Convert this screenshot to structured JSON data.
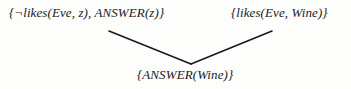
{
  "diagram": {
    "type": "resolution-proof-tree",
    "background_color": "#fdfdfc",
    "ink_color": "#1a1a1a",
    "parents": [
      {
        "id": "left-clause",
        "text": "{¬likes(Eve, z), ANSWER(z)}"
      },
      {
        "id": "right-clause",
        "text": "{likes(Eve, Wine)}"
      }
    ],
    "resolvent": {
      "id": "bottom-clause",
      "text": "{ANSWER(Wine)}"
    },
    "edges": [
      {
        "id": "edge-left",
        "from": "left-clause",
        "to": "bottom-clause",
        "x1": 109,
        "y1": 31,
        "x2": 191,
        "y2": 64
      },
      {
        "id": "edge-right",
        "from": "right-clause",
        "to": "bottom-clause",
        "x1": 191,
        "y1": 64,
        "x2": 272,
        "y2": 31
      }
    ]
  }
}
